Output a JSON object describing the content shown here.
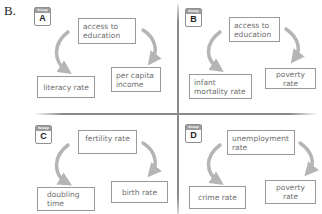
{
  "part_label": "B.",
  "badge_header": "Group",
  "colors": {
    "box_border": "#9a9a9a",
    "box_text": "#6e6e6e",
    "arrow": "#b5b5b5",
    "divider": "#8a8a8a",
    "badge_header": "#9c9c9c"
  },
  "groups": [
    {
      "letter": "A",
      "top": "access to education",
      "left": "literacy rate",
      "right": "per capita income"
    },
    {
      "letter": "B",
      "top": "access to education",
      "left": "infant mortality rate",
      "right": "poverty rate"
    },
    {
      "letter": "C",
      "top": "fertility rate",
      "left": "doubling time",
      "right": "birth rate"
    },
    {
      "letter": "D",
      "top": "unemployment rate",
      "left": "crime rate",
      "right": "poverty rate"
    }
  ]
}
